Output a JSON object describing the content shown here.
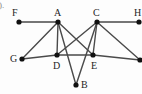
{
  "figure": {
    "tag": ").",
    "width": 142,
    "height": 94,
    "background_color": "#fdfdfd",
    "edge_color": "#4a4a4a",
    "vertex_color": "#111111",
    "label_color": "#1d1d1d"
  },
  "chart_data": {
    "type": "diagram",
    "subtype": "undirected-graph",
    "title": "",
    "xlabel": "",
    "ylabel": "",
    "nodes": [
      {
        "id": "F",
        "label": "F",
        "x": 19,
        "y": 22,
        "label_x": 12,
        "label_y": 8,
        "label_pos": "above-left"
      },
      {
        "id": "A",
        "label": "A",
        "x": 58,
        "y": 22,
        "label_x": 54,
        "label_y": 8,
        "label_pos": "above"
      },
      {
        "id": "C",
        "label": "C",
        "x": 97,
        "y": 22,
        "label_x": 93,
        "label_y": 8,
        "label_pos": "above"
      },
      {
        "id": "H",
        "label": "H",
        "x": 139,
        "y": 22,
        "label_x": 134,
        "label_y": 8,
        "label_pos": "above"
      },
      {
        "id": "G",
        "label": "G",
        "x": 22,
        "y": 59,
        "label_x": 10,
        "label_y": 54,
        "label_pos": "left"
      },
      {
        "id": "D",
        "label": "D",
        "x": 57,
        "y": 55,
        "label_x": 53,
        "label_y": 61,
        "label_pos": "below"
      },
      {
        "id": "E",
        "label": "E",
        "x": 93,
        "y": 55,
        "label_x": 91,
        "label_y": 61,
        "label_pos": "below"
      },
      {
        "id": "I",
        "label": "",
        "x": 140,
        "y": 60,
        "label_x": 140,
        "label_y": 60,
        "label_pos": "none"
      },
      {
        "id": "B",
        "label": "B",
        "x": 76,
        "y": 85,
        "label_x": 81,
        "label_y": 80,
        "label_pos": "right"
      }
    ],
    "edges": [
      {
        "from": "F",
        "to": "A"
      },
      {
        "from": "C",
        "to": "H"
      },
      {
        "from": "A",
        "to": "G"
      },
      {
        "from": "A",
        "to": "D"
      },
      {
        "from": "A",
        "to": "E"
      },
      {
        "from": "A",
        "to": "B"
      },
      {
        "from": "C",
        "to": "D"
      },
      {
        "from": "C",
        "to": "E"
      },
      {
        "from": "C",
        "to": "B"
      },
      {
        "from": "C",
        "to": "I"
      },
      {
        "from": "G",
        "to": "D"
      },
      {
        "from": "D",
        "to": "E"
      },
      {
        "from": "E",
        "to": "I"
      }
    ],
    "node_count": 9,
    "edge_count": 13,
    "vertex_radius": 2.6,
    "edge_width": 1.4
  }
}
